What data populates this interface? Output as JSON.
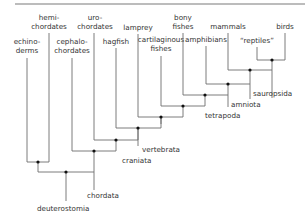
{
  "diagram": {
    "type": "cladogram",
    "title": "",
    "colors": {
      "line": "#6e6e6e",
      "node": "#111111",
      "text": "#333333",
      "background": "#ffffff"
    },
    "leaves": [
      {
        "id": "echinoderms",
        "label_lines": [
          "echino-",
          "derms"
        ]
      },
      {
        "id": "hemichordates",
        "label_lines": [
          "hemi-",
          "chordates"
        ]
      },
      {
        "id": "cephalochordates",
        "label_lines": [
          "cephalo-",
          "chordates"
        ]
      },
      {
        "id": "urochordates",
        "label_lines": [
          "uro-",
          "chordates"
        ]
      },
      {
        "id": "hagfish",
        "label_lines": [
          "hagfish"
        ]
      },
      {
        "id": "lamprey",
        "label_lines": [
          "lamprey"
        ]
      },
      {
        "id": "cartilaginous-fishes",
        "label_lines": [
          "cartilaginous",
          "fishes"
        ]
      },
      {
        "id": "bony-fishes",
        "label_lines": [
          "bony",
          "fishes"
        ]
      },
      {
        "id": "amphibians",
        "label_lines": [
          "amphibians"
        ]
      },
      {
        "id": "mammals",
        "label_lines": [
          "mammals"
        ]
      },
      {
        "id": "reptiles",
        "label_lines": [
          "“reptiles”"
        ]
      },
      {
        "id": "birds",
        "label_lines": [
          "birds"
        ]
      }
    ],
    "clades": [
      {
        "id": "deuterostomia",
        "label": "deuterostomia"
      },
      {
        "id": "chordata",
        "label": "chordata"
      },
      {
        "id": "craniata",
        "label": "craniata"
      },
      {
        "id": "vertebrata",
        "label": "vertebrata"
      },
      {
        "id": "tetrapoda",
        "label": "tetrapoda"
      },
      {
        "id": "amniota",
        "label": "amniota"
      },
      {
        "id": "sauropsida",
        "label": "sauropsida"
      }
    ]
  }
}
